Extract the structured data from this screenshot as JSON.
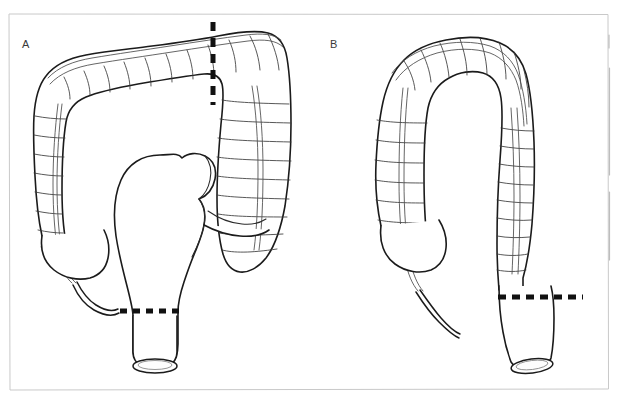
{
  "figure": {
    "background_color": "#ffffff",
    "ink_color": "#1b1b1b",
    "frame_color": "#c9c9c9",
    "dash_color": "#111111",
    "width": 620,
    "height": 403
  },
  "panels": [
    {
      "id": "panel-a",
      "label": "A",
      "label_x": 22,
      "label_y": 48,
      "description": "Large bowel with wide haustrated transverse colon, dilated sigmoid loop and rectal stump",
      "resection_lines": [
        {
          "id": "vertical-resection-line",
          "orientation": "vertical",
          "x": 213,
          "y_start": 22,
          "y_end": 105,
          "label": "proximal transverse resection level"
        },
        {
          "id": "horizontal-resection-line",
          "orientation": "horizontal",
          "y": 311,
          "x_start": 120,
          "x_end": 180,
          "label": "rectal resection level"
        }
      ]
    },
    {
      "id": "panel-b",
      "label": "B",
      "label_x": 330,
      "label_y": 48,
      "description": "Large bowel with narrowed descending colon and straight rectal stump",
      "resection_lines": [
        {
          "id": "horizontal-resection-line",
          "orientation": "horizontal",
          "y": 297,
          "x_start": 498,
          "x_end": 583,
          "label": "rectal resection level"
        }
      ]
    }
  ],
  "frame": {
    "x": 8,
    "y": 13,
    "width": 600,
    "height": 377
  },
  "edge_ticks": [
    {
      "x": 609,
      "y_start": 35,
      "y_end": 48
    },
    {
      "x": 609,
      "y_start": 68,
      "y_end": 175
    },
    {
      "x": 609,
      "y_start": 192,
      "y_end": 260
    }
  ]
}
